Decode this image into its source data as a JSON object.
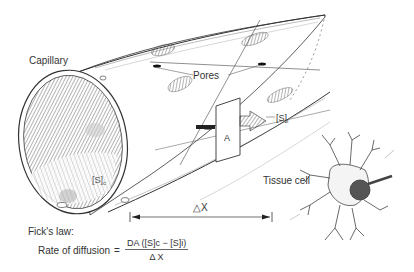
{
  "diagram": {
    "type": "anatomical-illustration",
    "labels": {
      "capillary": "Capillary",
      "pores": "Pores",
      "area": "A",
      "conc_capillary": "[S]",
      "conc_capillary_sub": "c",
      "conc_interstitial": "[S]",
      "conc_interstitial_sub": "i",
      "tissue_cell": "Tissue cell",
      "distance": "△X"
    },
    "formula": {
      "title": "Fick's law:",
      "lhs": "Rate of diffusion",
      "equals": "=",
      "numerator": "DA  ([S]c − [S]i)",
      "denominator": "Δ X"
    },
    "colors": {
      "ink": "#222222",
      "background": "#ffffff"
    }
  }
}
